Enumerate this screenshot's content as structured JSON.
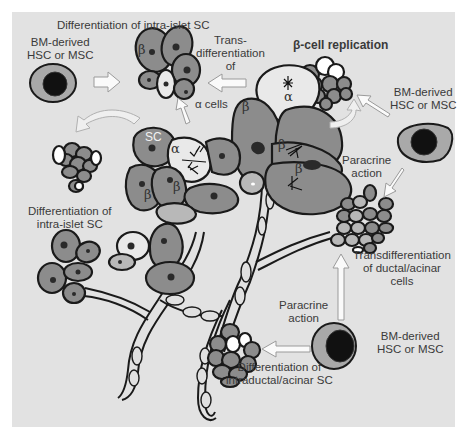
{
  "figure": {
    "background": "#e2e2e2",
    "cell_fill": "#8c8c8c",
    "outline": "#1a1a1a",
    "labels": {
      "top_left_source": {
        "line1": "BM-derived",
        "line2": "HSC or MSC"
      },
      "top_title": "Differentiation of  intra-islet SC",
      "transdiff_alpha": {
        "line1": "Trans-",
        "line2": "differentiation",
        "line3": "of",
        "line4": "α cells"
      },
      "beta_replication": "β-cell replication",
      "top_right_source": {
        "line1": "BM-derived",
        "line2": "HSC or MSC"
      },
      "paracrine_upper": {
        "line1": "Paracrine",
        "line2": "action"
      },
      "left_intra_islet": {
        "line1": "Differentiation of",
        "line2": "intra-islet SC"
      },
      "transdiff_ductal": {
        "line1": "Transdifferentiation",
        "line2": "of ductal/acinar",
        "line3": "cells"
      },
      "paracrine_lower": {
        "line1": "Paracrine",
        "line2": "action"
      },
      "bottom_right_source": {
        "line1": "BM-derived",
        "line2": "HSC or MSC"
      },
      "intraductal": {
        "line1": "Differentiation of",
        "line2": "intraductal/acinar SC"
      }
    },
    "cell_labels": {
      "beta": "β",
      "alpha": "α",
      "sc": "SC"
    },
    "icons": [
      "hsc-msc-cell-icon",
      "islet-cluster-icon",
      "acinar-cluster-icon",
      "duct-icon",
      "block-arrow-icon",
      "curved-arrow-icon",
      "mitosis-icon"
    ]
  }
}
